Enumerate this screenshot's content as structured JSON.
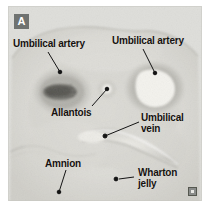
{
  "figure": {
    "panel_letter": "A",
    "corner_mark_icon": "watermark-icon"
  },
  "annotations": [
    {
      "id": "umbilical-artery-left",
      "text": "Umbilical artery",
      "label_x": 13,
      "label_y": 38,
      "leader": {
        "x1": 48,
        "y1": 52,
        "x2": 60,
        "y2": 72
      },
      "target_dot": {
        "x": 60,
        "y": 72
      }
    },
    {
      "id": "umbilical-artery-right",
      "text": "Umbilical artery",
      "label_x": 112,
      "label_y": 35,
      "leader": {
        "x1": 143,
        "y1": 49,
        "x2": 155,
        "y2": 73
      },
      "target_dot": {
        "x": 155,
        "y": 73
      }
    },
    {
      "id": "allantois",
      "text": "Allantois",
      "label_x": 51,
      "label_y": 107,
      "leader": {
        "x1": 92,
        "y1": 106,
        "x2": 107,
        "y2": 89
      },
      "target_dot": {
        "x": 107,
        "y": 89
      }
    },
    {
      "id": "umbilical-vein",
      "text": "Umbilical\nvein",
      "label_x": 141,
      "label_y": 112,
      "leader": {
        "x1": 139,
        "y1": 122,
        "x2": 105,
        "y2": 136
      },
      "target_dot": {
        "x": 105,
        "y": 136
      }
    },
    {
      "id": "amnion",
      "text": "Amnion",
      "label_x": 45,
      "label_y": 158,
      "leader": {
        "x1": 66,
        "y1": 170,
        "x2": 59,
        "y2": 192
      },
      "target_dot": {
        "x": 59,
        "y": 192
      }
    },
    {
      "id": "wharton-jelly",
      "text": "Wharton\njelly",
      "label_x": 138,
      "label_y": 167,
      "leader": {
        "x1": 134,
        "y1": 177,
        "x2": 117,
        "y2": 179
      },
      "target_dot": {
        "x": 117,
        "y": 179
      }
    }
  ],
  "colors": {
    "page_background": "#ffffff",
    "plate_background": "#d9d9d6",
    "tissue_light": "#e4e3df",
    "tissue_mid": "#c9c8c3",
    "tissue_dark": "#8d8c87",
    "lumen_bright": "#f2f1ec",
    "artery_dark_lumen": "#6e6d68",
    "label_text": "#15110f",
    "badge_background": "#6f7270",
    "badge_text": "#ffffff",
    "leader_line": "#141414"
  }
}
